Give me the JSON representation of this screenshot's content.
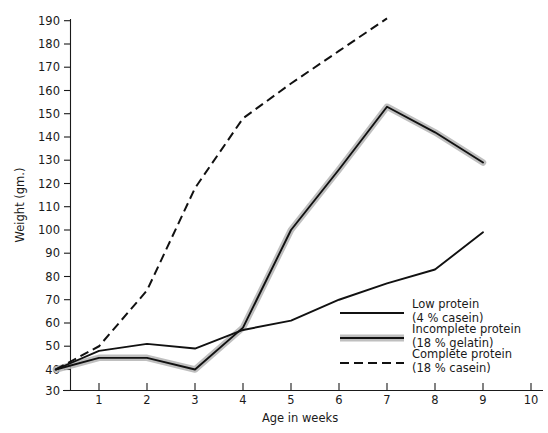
{
  "chart_data": {
    "type": "line",
    "title": "",
    "xlabel": "Age in weeks",
    "ylabel": "Weight (gm.)",
    "xlim": [
      0,
      10
    ],
    "ylim": [
      30,
      190
    ],
    "xticks": [
      1,
      2,
      3,
      4,
      5,
      6,
      7,
      8,
      9,
      10
    ],
    "yticks": [
      30,
      40,
      50,
      60,
      70,
      80,
      90,
      100,
      110,
      120,
      130,
      140,
      150,
      160,
      170,
      180,
      190
    ],
    "grid": false,
    "legend_position": "right-inside",
    "series": [
      {
        "name": "Low protein",
        "sub": "(4 % casein)",
        "style": "solid",
        "x": [
          0.1,
          1,
          2,
          3,
          4,
          5,
          6,
          7,
          8,
          9
        ],
        "values": [
          40,
          48,
          51,
          49,
          57,
          61,
          70,
          77,
          83,
          99
        ]
      },
      {
        "name": "Incomplete protein",
        "sub": "(18 % gelatin)",
        "style": "shaded-band",
        "x": [
          0.1,
          1,
          2,
          3,
          4,
          5,
          6,
          7,
          8,
          9
        ],
        "values": [
          40,
          45,
          45,
          40,
          58,
          100,
          126,
          153,
          142,
          129
        ]
      },
      {
        "name": "Complete protein",
        "sub": "(18 % casein)",
        "style": "dashed",
        "x": [
          0.1,
          1,
          2,
          3,
          4,
          5,
          6,
          7
        ],
        "values": [
          40,
          50,
          74,
          118,
          148,
          163,
          177,
          191
        ]
      }
    ]
  },
  "legend": {
    "entries": [
      {
        "label": "Low protein",
        "sub": "(4 % casein)",
        "style": "solid"
      },
      {
        "label": "Incomplete protein",
        "sub": "(18 % gelatin)",
        "style": "shaded-band"
      },
      {
        "label": "Complete protein",
        "sub": "(18 % casein)",
        "style": "dashed"
      }
    ]
  },
  "colors": {
    "line": "#111111",
    "halo": "#b4b4b4",
    "axis": "#1a1a1a",
    "background": "#ffffff"
  }
}
